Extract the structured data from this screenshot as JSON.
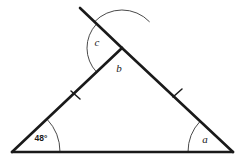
{
  "figure": {
    "kind": "geometry-diagram",
    "background_color": "#ffffff",
    "line_color": "#1a1a1a",
    "arc_color": "#4a4a4a",
    "vertices": {
      "bottom_left": {
        "x": 12,
        "y": 152
      },
      "bottom_right": {
        "x": 233,
        "y": 152
      },
      "apex": {
        "x": 122,
        "y": 48
      },
      "extension_end": {
        "x": 80,
        "y": 8
      }
    },
    "segments": [
      {
        "name": "base-side",
        "x1": 12,
        "y1": 152,
        "x2": 233,
        "y2": 152
      },
      {
        "name": "left-side",
        "x1": 12,
        "y1": 152,
        "x2": 122,
        "y2": 48
      },
      {
        "name": "right-side",
        "x1": 233,
        "y1": 152,
        "x2": 122,
        "y2": 48
      },
      {
        "name": "extension-ray",
        "x1": 122,
        "y1": 48,
        "x2": 80,
        "y2": 8
      }
    ],
    "tick_marks": [
      {
        "name": "tick-left-side",
        "x1": 71,
        "y1": 91,
        "x2": 80,
        "y2": 99
      },
      {
        "name": "tick-right-side",
        "x1": 173,
        "y1": 97,
        "x2": 182,
        "y2": 89
      }
    ],
    "angles": [
      {
        "id": "angle-48",
        "label": "48°",
        "label_x": 41,
        "label_y": 141,
        "vertex_x": 12,
        "vertex_y": 152,
        "arc_radius": 48,
        "arc_start_deg": 0,
        "arc_end_deg": 43.4,
        "known": true
      },
      {
        "id": "angle-a",
        "label": "a",
        "label_x": 205,
        "label_y": 143,
        "vertex_x": 233,
        "vertex_y": 152,
        "arc_radius": 45,
        "arc_start_deg": 136.9,
        "arc_end_deg": 180,
        "known": false
      },
      {
        "id": "angle-b",
        "label": "b",
        "label_x": 119,
        "label_y": 72,
        "vertex_x": 122,
        "vertex_y": 48,
        "arc_radius": 38,
        "arc_start_deg": 43.4,
        "arc_end_deg": 136.9,
        "known": false
      },
      {
        "id": "angle-c",
        "label": "c",
        "label_x": 97,
        "label_y": 46,
        "vertex_x": 122,
        "vertex_y": 48,
        "arc_radius": 35,
        "arc_start_deg": 136.9,
        "arc_end_deg": 223.6,
        "known": false
      }
    ]
  }
}
